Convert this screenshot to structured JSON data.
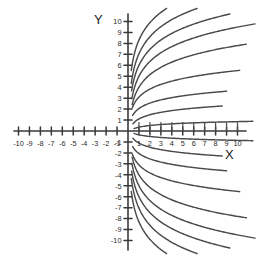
{
  "chart_data": {
    "type": "line",
    "title": "",
    "xlabel": "X",
    "ylabel": "Y",
    "xlim": [
      -11,
      12.5
    ],
    "ylim": [
      -10.8,
      10.8
    ],
    "grid": false,
    "legend": "none",
    "x_ticks": [
      -10,
      -9,
      -8,
      -7,
      -6,
      -5,
      -4,
      -3,
      -2,
      -1,
      1,
      2,
      3,
      4,
      5,
      6,
      7,
      8,
      9,
      10
    ],
    "x_tick_labels": [
      "-10",
      "-9",
      "-8",
      "-7",
      "-6",
      "-5",
      "-4",
      "-3",
      "-2",
      "-1",
      "1",
      "2",
      "3",
      "4",
      "5",
      "6",
      "7",
      "8",
      "9",
      "10"
    ],
    "y_ticks": [
      -10,
      -9,
      -8,
      -7,
      -6,
      -5,
      -4,
      -3,
      -2,
      -1,
      1,
      2,
      3,
      4,
      5,
      6,
      7,
      8,
      9,
      10
    ],
    "y_tick_labels": [
      "-10",
      "-9",
      "-8",
      "-7",
      "-6",
      "-5",
      "-4",
      "-3",
      "-2",
      "-1",
      "1",
      "2",
      "3",
      "4",
      "5",
      "6",
      "7",
      "8",
      "9",
      "10"
    ],
    "series": [
      {
        "name": "c-up-1",
        "a": 2.3,
        "b": 8.3,
        "x_start": 0.3,
        "x_end": 6.1
      },
      {
        "name": "c-up-2",
        "a": 2.25,
        "b": 7.05,
        "x_start": 0.3,
        "x_end": 7.6
      },
      {
        "name": "c-up-3",
        "a": 2.1,
        "b": 6.0,
        "x_start": 0.33,
        "x_end": 9.3
      },
      {
        "name": "c-up-4",
        "a": 1.95,
        "b": 5.0,
        "x_start": 0.35,
        "x_end": 11.6
      },
      {
        "name": "c-up-5",
        "a": 1.65,
        "b": 4.0,
        "x_start": 0.38,
        "x_end": 10.8
      },
      {
        "name": "c-up-6",
        "a": 1.05,
        "b": 3.1,
        "x_start": 0.4,
        "x_end": 10.2
      },
      {
        "name": "c-up-7",
        "a": 0.72,
        "b": 2.05,
        "x_start": 0.42,
        "x_end": 9.0
      },
      {
        "name": "c-up-8",
        "a": 0.55,
        "b": 1.1,
        "x_start": 0.45,
        "x_end": 8.6
      },
      {
        "name": "c-up-9",
        "a": 0.22,
        "b": 0.35,
        "x_start": 0.55,
        "x_end": 11.4
      },
      {
        "name": "c-dn-1",
        "a": -2.3,
        "b": -8.3,
        "x_start": 0.3,
        "x_end": 6.1
      },
      {
        "name": "c-dn-2",
        "a": -2.25,
        "b": -7.05,
        "x_start": 0.3,
        "x_end": 7.6
      },
      {
        "name": "c-dn-3",
        "a": -2.1,
        "b": -6.0,
        "x_start": 0.33,
        "x_end": 9.3
      },
      {
        "name": "c-dn-4",
        "a": -1.95,
        "b": -5.0,
        "x_start": 0.35,
        "x_end": 11.6
      },
      {
        "name": "c-dn-5",
        "a": -1.65,
        "b": -4.0,
        "x_start": 0.38,
        "x_end": 10.8
      },
      {
        "name": "c-dn-6",
        "a": -1.05,
        "b": -3.1,
        "x_start": 0.4,
        "x_end": 10.2
      },
      {
        "name": "c-dn-7",
        "a": -0.72,
        "b": -2.05,
        "x_start": 0.42,
        "x_end": 9.0
      },
      {
        "name": "c-dn-8",
        "a": -0.55,
        "b": -1.1,
        "x_start": 0.45,
        "x_end": 8.6
      },
      {
        "name": "c-dn-9",
        "a": -0.22,
        "b": -0.35,
        "x_start": 0.55,
        "x_end": 11.4
      }
    ],
    "colors": {
      "axis": "#3a3a3a",
      "curve": "#4a4a4a",
      "label": "#2b2b2b",
      "background": "#ffffff"
    }
  },
  "geometry": {
    "origin_x": 128,
    "origin_y": 131,
    "unit_px": 10.95,
    "tick_len_major": 8,
    "tick_len_minor": 8,
    "axis_x_left": 14,
    "axis_x_right": 246,
    "axis_y_top": 14,
    "axis_y_bottom": 250
  },
  "labels": {
    "x_axis_name": "X",
    "y_axis_name": "Y"
  }
}
